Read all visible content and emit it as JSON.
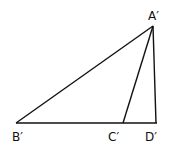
{
  "diagram": {
    "type": "geometry-triangle",
    "points": {
      "A": {
        "label": "A′",
        "x": 153,
        "y": 26
      },
      "B": {
        "label": "B′",
        "x": 16,
        "y": 123
      },
      "C": {
        "label": "C′",
        "x": 123,
        "y": 123
      },
      "D": {
        "label": "D′",
        "x": 156,
        "y": 123
      }
    },
    "segments": [
      "A′B′",
      "B′D′",
      "A′C′",
      "A′D′"
    ],
    "stroke_color": "#111111"
  }
}
